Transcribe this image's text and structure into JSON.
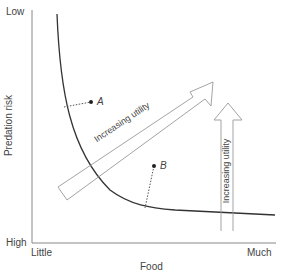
{
  "axes": {
    "y_label": "Predation risk",
    "y_top": "Low",
    "y_bottom": "High",
    "x_label": "Food",
    "x_left": "Little",
    "x_right": "Much"
  },
  "points": [
    {
      "id": "A",
      "label": "A"
    },
    {
      "id": "B",
      "label": "B"
    }
  ],
  "arrows": {
    "diagonal_label": "Increasing utility",
    "vertical_label": "Increasing utility"
  },
  "colors": {
    "curve": "#333333",
    "axis": "#888888",
    "arrow": "#999999"
  }
}
